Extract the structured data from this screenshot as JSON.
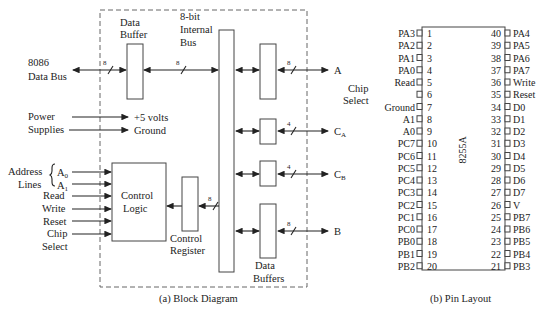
{
  "block_diagram": {
    "caption": "(a) Block Diagram",
    "data_bus": {
      "line1": "8086",
      "line2": "Data Bus",
      "width_label": "8"
    },
    "data_buffer": {
      "line1": "Data",
      "line2": "Buffer"
    },
    "internal_bus": {
      "line1": "8-bit",
      "line2": "Internal",
      "line3": "Bus",
      "width_label": "8"
    },
    "power": {
      "line1": "Power",
      "line2": "Supplies",
      "out1": "+5 volts",
      "out2": "Ground"
    },
    "address": {
      "line1": "Address",
      "line2": "Lines",
      "a0": "A",
      "a0_sub": "0",
      "a1": "A",
      "a1_sub": "1"
    },
    "inputs": [
      "Read",
      "Write",
      "Reset",
      "Chip",
      "Select"
    ],
    "control_logic": {
      "line1": "Control",
      "line2": "Logic"
    },
    "control_register": {
      "line1": "Control",
      "line2": "Register",
      "width_label": "8"
    },
    "data_buffers": {
      "line1": "Data",
      "line2": "Buffers"
    },
    "ports": [
      {
        "name": "A",
        "sub": "",
        "width": "8"
      },
      {
        "name": "C",
        "sub": "A",
        "width": "4"
      },
      {
        "name": "C",
        "sub": "B",
        "width": "4"
      },
      {
        "name": "B",
        "sub": "",
        "width": "8"
      }
    ]
  },
  "pin_layout": {
    "caption": "(b) Pin Layout",
    "chip_name": "8255A",
    "side_label": {
      "line1": "Chip",
      "line2": "Select"
    },
    "left_pins": [
      {
        "num": "1",
        "name": "PA3"
      },
      {
        "num": "2",
        "name": "PA2"
      },
      {
        "num": "3",
        "name": "PA1"
      },
      {
        "num": "4",
        "name": "PA0"
      },
      {
        "num": "5",
        "name": "Read"
      },
      {
        "num": "6",
        "name": ""
      },
      {
        "num": "7",
        "name": "Ground"
      },
      {
        "num": "8",
        "name": "A1"
      },
      {
        "num": "9",
        "name": "A0"
      },
      {
        "num": "10",
        "name": "PC7"
      },
      {
        "num": "11",
        "name": "PC6"
      },
      {
        "num": "12",
        "name": "PC5"
      },
      {
        "num": "13",
        "name": "PC4"
      },
      {
        "num": "14",
        "name": "PC3"
      },
      {
        "num": "15",
        "name": "PC2"
      },
      {
        "num": "16",
        "name": "PC1"
      },
      {
        "num": "17",
        "name": "PC0"
      },
      {
        "num": "18",
        "name": "PB0"
      },
      {
        "num": "19",
        "name": "PB1"
      },
      {
        "num": "20",
        "name": "PB2"
      }
    ],
    "right_pins": [
      {
        "num": "40",
        "name": "PA4"
      },
      {
        "num": "39",
        "name": "PA5"
      },
      {
        "num": "38",
        "name": "PA6"
      },
      {
        "num": "37",
        "name": "PA7"
      },
      {
        "num": "36",
        "name": "Write"
      },
      {
        "num": "35",
        "name": "Reset"
      },
      {
        "num": "34",
        "name": "D0"
      },
      {
        "num": "33",
        "name": "D1"
      },
      {
        "num": "32",
        "name": "D2"
      },
      {
        "num": "31",
        "name": "D3"
      },
      {
        "num": "30",
        "name": "D4"
      },
      {
        "num": "29",
        "name": "D5"
      },
      {
        "num": "28",
        "name": "D6"
      },
      {
        "num": "27",
        "name": "D7"
      },
      {
        "num": "26",
        "name": "V"
      },
      {
        "num": "25",
        "name": "PB7"
      },
      {
        "num": "24",
        "name": "PB6"
      },
      {
        "num": "23",
        "name": "PB5"
      },
      {
        "num": "22",
        "name": "PB4"
      },
      {
        "num": "21",
        "name": "PB3"
      }
    ]
  }
}
